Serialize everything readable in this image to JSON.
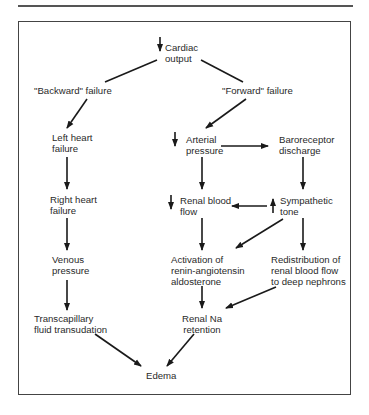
{
  "figure": {
    "nodes": {
      "cardiac_output": [
        "Cardiac",
        "output"
      ],
      "backward_failure": "\"Backward\" failure",
      "forward_failure": "\"Forward\" failure",
      "left_heart_failure": [
        "Left heart",
        "failure"
      ],
      "right_heart_failure": [
        "Right heart",
        "failure"
      ],
      "venous_pressure": [
        "Venous",
        "pressure"
      ],
      "transcapillary": [
        "Transcapillary",
        "fluid transudation"
      ],
      "arterial_pressure": [
        "Arterial",
        "pressure"
      ],
      "baroreceptor": [
        "Baroreceptor",
        "discharge"
      ],
      "renal_blood_flow": [
        "Renal blood",
        "flow"
      ],
      "sympathetic_tone": [
        "Sympathetic",
        "tone"
      ],
      "activation_raa": [
        "Activation of",
        "renin-angiotensin",
        "aldosterone"
      ],
      "redistribution": [
        "Redistribution of",
        "renal blood flow",
        "to deep nephrons"
      ],
      "renal_na": [
        "Renal Na",
        "retention"
      ],
      "edema": "Edema"
    },
    "indicators": {
      "cardiac_output": "decrease",
      "arterial_pressure": "decrease",
      "renal_blood_flow": "decrease",
      "sympathetic_tone": "increase"
    }
  }
}
